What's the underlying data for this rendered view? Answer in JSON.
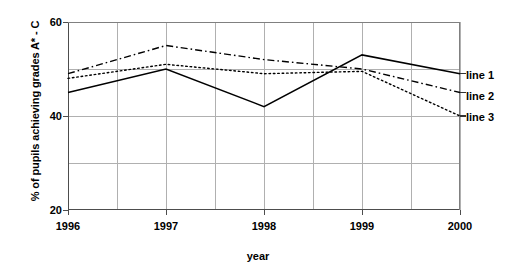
{
  "chart_data": {
    "type": "line",
    "title": "",
    "xlabel": "year",
    "ylabel": "% of pupils achieving grades A* - C",
    "categories": [
      "1996",
      "1997",
      "1998",
      "1999",
      "2000"
    ],
    "x": [
      1996,
      1997,
      1998,
      1999,
      2000
    ],
    "xlim": [
      1996,
      2000
    ],
    "ylim": [
      20,
      60
    ],
    "yticks": [
      20,
      40,
      60
    ],
    "ytick_labels": [
      "20",
      "40",
      "60"
    ],
    "gridlines": {
      "horizontal_values": [
        30,
        40,
        50
      ],
      "vertical_values": [
        1996,
        1996.5,
        1997,
        1997.5,
        1998,
        1998.5,
        1999,
        1999.5,
        2000
      ],
      "grid_on": true,
      "grid_color": "#b0b0b0"
    },
    "legend_position": "right",
    "series": [
      {
        "name": "line 1",
        "style": "solid",
        "color": "#000000",
        "values": [
          45,
          50,
          42,
          53,
          49
        ]
      },
      {
        "name": "line 2",
        "style": "dash-dot",
        "color": "#000000",
        "values": [
          49,
          55,
          52,
          50,
          45
        ]
      },
      {
        "name": "line 3",
        "style": "dotted",
        "color": "#000000",
        "values": [
          48,
          51,
          49,
          49.5,
          40
        ]
      }
    ]
  },
  "axes": {
    "y_title": "% of pupils achieving grades A* - C",
    "x_title": "year",
    "y_ticks": [
      {
        "label": "60",
        "value": 60
      },
      {
        "label": "40",
        "value": 40
      },
      {
        "label": "20",
        "value": 20
      }
    ],
    "x_ticks": [
      {
        "label": "1996",
        "value": 1996
      },
      {
        "label": "1997",
        "value": 1997
      },
      {
        "label": "1998",
        "value": 1998
      },
      {
        "label": "1999",
        "value": 1999
      },
      {
        "label": "2000",
        "value": 2000
      }
    ]
  },
  "legend": {
    "items": [
      {
        "label": "line 1"
      },
      {
        "label": "line 2"
      },
      {
        "label": "line 3"
      }
    ]
  }
}
